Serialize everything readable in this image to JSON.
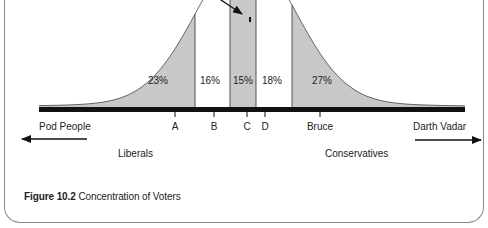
{
  "figure": {
    "caption_number": "Figure 10.2",
    "caption_text": " Concentration of Voters"
  },
  "chart_data": {
    "type": "area",
    "title": "Concentration of Voters",
    "segments": [
      {
        "label": "23%",
        "value": 23,
        "fill": "#c8c8c8"
      },
      {
        "label": "16%",
        "value": 16,
        "fill": "#ffffff"
      },
      {
        "label": "15%",
        "value": 15,
        "fill": "#c8c8c8"
      },
      {
        "label": "18%",
        "value": 18,
        "fill": "#ffffff"
      },
      {
        "label": "27%",
        "value": 27,
        "fill": "#c8c8c8"
      }
    ],
    "position_markers": [
      "A",
      "B",
      "C",
      "D",
      "Bruce"
    ],
    "axis_ends": {
      "left": "Pod People",
      "right": "Darth Vadar"
    },
    "direction_labels": {
      "left": "Liberals",
      "right": "Conservatives"
    },
    "colors": {
      "shaded": "#c8c8c8",
      "baseline": "#111111",
      "line": "#333333"
    }
  }
}
